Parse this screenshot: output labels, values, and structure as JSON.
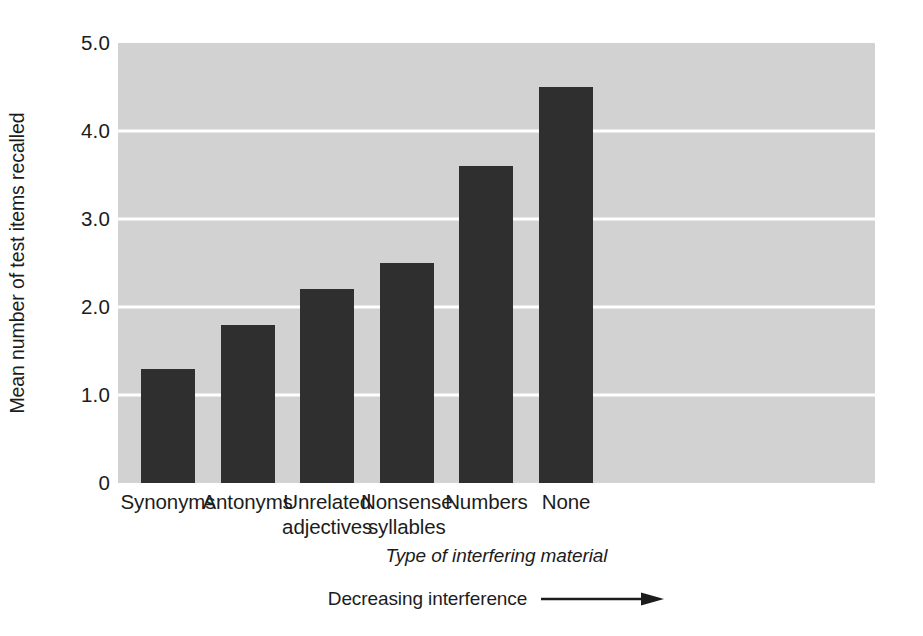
{
  "chart_data": {
    "type": "bar",
    "title": "",
    "categories": [
      "Synonyms",
      "Antonyms",
      "Unrelated adjectives",
      "Nonsense syllables",
      "Numbers",
      "None"
    ],
    "values": [
      1.3,
      1.8,
      2.2,
      2.5,
      3.6,
      4.5
    ],
    "xlabel": "Type of interfering material",
    "ylabel": "Mean number of test items recalled",
    "ylim": [
      0,
      5.0
    ],
    "yticks": [
      "0",
      "1.0",
      "2.0",
      "3.0",
      "4.0",
      "5.0"
    ],
    "ytick_values": [
      0,
      1.0,
      2.0,
      3.0,
      4.0,
      5.0
    ],
    "gridlines": [
      1.0,
      2.0,
      3.0,
      4.0
    ],
    "grid": true,
    "legend": "none",
    "annotation": "Decreasing interference",
    "annotation_arrow": "right-arrow-icon",
    "colors": {
      "bar": "#2f2f2f",
      "plot_background": "#d2d2d2",
      "gridline": "#ffffff",
      "page_background": "#ffffff",
      "text": "#1c1c1c"
    }
  },
  "axis": {
    "y": {
      "title": "Mean number of test items recalled",
      "ticks": [
        {
          "label": "5.0",
          "value": 5.0
        },
        {
          "label": "4.0",
          "value": 4.0
        },
        {
          "label": "3.0",
          "value": 3.0
        },
        {
          "label": "2.0",
          "value": 2.0
        },
        {
          "label": "1.0",
          "value": 1.0
        },
        {
          "label": "0",
          "value": 0
        }
      ]
    },
    "x": {
      "title": "Type of interfering material",
      "ticks": [
        {
          "line1": "Synonyms",
          "line2": ""
        },
        {
          "line1": "Antonyms",
          "line2": ""
        },
        {
          "line1": "Unrelated",
          "line2": "adjectives"
        },
        {
          "line1": "Nonsense",
          "line2": "syllables"
        },
        {
          "line1": "Numbers",
          "line2": ""
        },
        {
          "line1": "None",
          "line2": ""
        }
      ]
    }
  },
  "annotation": {
    "label": "Decreasing interference"
  },
  "bars": [
    {
      "category": "Synonyms",
      "value": 1.3
    },
    {
      "category": "Antonyms",
      "value": 1.8
    },
    {
      "category": "Unrelated adjectives",
      "value": 2.2
    },
    {
      "category": "Nonsense syllables",
      "value": 2.5
    },
    {
      "category": "Numbers",
      "value": 3.6
    },
    {
      "category": "None",
      "value": 4.5
    }
  ]
}
